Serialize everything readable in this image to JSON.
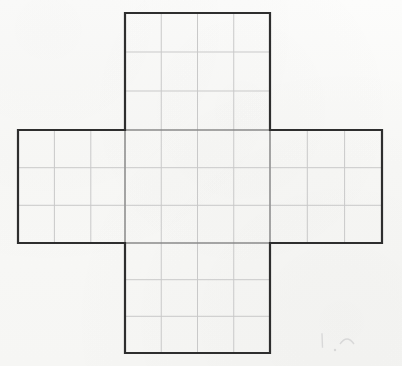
{
  "document": {
    "title": "Cube Net Grid Worksheet",
    "background_color": "#fcfcfb",
    "paper_tint": "#f9f9f8"
  },
  "styles": {
    "outline_color": "#2e2e2e",
    "outline_width": 2.2,
    "grid_color": "#c9c9c9",
    "grid_width": 1,
    "pencil_color": "#d8d8d8"
  },
  "chart_data": {
    "type": "diagram",
    "subtitle": "",
    "xlabel": "",
    "ylabel": "",
    "grid": true,
    "legend": null,
    "units": "pixels",
    "canvas": {
      "width": 402,
      "height": 366
    },
    "cell_size": {
      "width": 36.25,
      "height": 37.6
    },
    "panels": [
      {
        "name": "top-flap",
        "label": "Top panel",
        "x": 125,
        "y": 13,
        "width": 145,
        "height": 117,
        "columns": 4,
        "rows": 3,
        "col_lines_x": [
          125,
          161.25,
          197.5,
          233.75,
          270
        ],
        "row_lines_y": [
          13,
          52,
          91,
          130
        ]
      },
      {
        "name": "horizontal-band",
        "label": "Middle band (left, center, right panels)",
        "x": 18,
        "y": 130,
        "width": 364,
        "height": 113,
        "columns": 10,
        "rows": 3,
        "col_lines_x": [
          18,
          54.4,
          90.8,
          125,
          161.25,
          197.5,
          233.75,
          270,
          307.3,
          344.6,
          382
        ],
        "row_lines_y": [
          130,
          167.7,
          205.3,
          243
        ]
      },
      {
        "name": "bottom-flap",
        "label": "Bottom panel",
        "x": 125,
        "y": 243,
        "width": 145,
        "height": 110,
        "columns": 4,
        "rows": 3,
        "col_lines_x": [
          125,
          161.25,
          197.5,
          233.75,
          270
        ],
        "row_lines_y": [
          243,
          279.7,
          316.3,
          353
        ]
      }
    ],
    "outline_path_points": [
      [
        125,
        13
      ],
      [
        270,
        13
      ],
      [
        270,
        130
      ],
      [
        382,
        130
      ],
      [
        382,
        243
      ],
      [
        270,
        243
      ],
      [
        270,
        353
      ],
      [
        125,
        353
      ],
      [
        125,
        243
      ],
      [
        18,
        243
      ],
      [
        18,
        130
      ],
      [
        125,
        130
      ]
    ],
    "face_count": 6,
    "total_squares": 34,
    "annotations": [
      {
        "name": "pencil-tick-mark",
        "type": "stray-pencil-mark",
        "shape": "short vertical stroke",
        "x": 322,
        "y": 334,
        "length": 13
      },
      {
        "name": "pencil-caret-mark",
        "type": "stray-pencil-mark",
        "shape": "small caret / arc",
        "x": 340,
        "y": 336,
        "width": 14,
        "height": 8
      },
      {
        "name": "pencil-dot-mark",
        "type": "stray-pencil-mark",
        "shape": "faint dot",
        "x": 335,
        "y": 350,
        "radius": 1.2
      }
    ]
  }
}
